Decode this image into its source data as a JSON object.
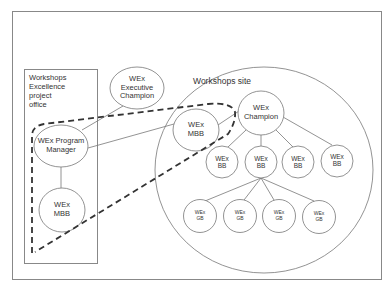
{
  "diagram": {
    "office_box": {
      "label_lines": [
        "Workshops",
        "Excellence",
        "project",
        "office"
      ]
    },
    "site": {
      "title": "Workshops site"
    },
    "nodes": {
      "exec_champion": {
        "lines": [
          "WEx",
          "Executive",
          "Champion"
        ]
      },
      "program_manager": {
        "lines": [
          "WEx Program",
          "Manager"
        ]
      },
      "office_mbb": {
        "lines": [
          "WEx",
          "MBB"
        ]
      },
      "site_mbb": {
        "lines": [
          "WEx",
          "MBB"
        ]
      },
      "champion": {
        "lines": [
          "WEx",
          "Champion"
        ]
      },
      "bb": [
        {
          "lines": [
            "WEx",
            "BB"
          ]
        },
        {
          "lines": [
            "WEx",
            "BB"
          ]
        },
        {
          "lines": [
            "WEx",
            "BB"
          ]
        },
        {
          "lines": [
            "WEx",
            "BB"
          ]
        }
      ],
      "gb": [
        {
          "lines": [
            "WEx",
            "GB"
          ]
        },
        {
          "lines": [
            "WEx",
            "GB"
          ]
        },
        {
          "lines": [
            "WEx",
            "GB"
          ]
        },
        {
          "lines": [
            "WEx",
            "GB"
          ]
        }
      ]
    },
    "colors": {
      "stroke": "#555555",
      "dashed": "#333333",
      "text": "#333333"
    }
  }
}
